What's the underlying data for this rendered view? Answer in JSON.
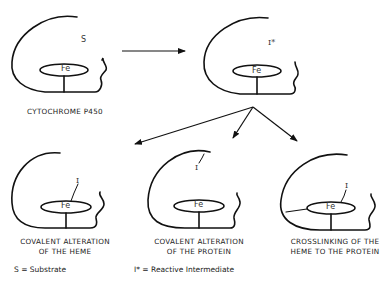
{
  "diagram": {
    "nodes": [
      {
        "id": "p450",
        "caption_line1": "CYTOCHROME  P450",
        "caption_line2": "",
        "symbol": "S",
        "heme_label": "Fe"
      },
      {
        "id": "intermediate",
        "caption_line1": "",
        "caption_line2": "",
        "symbol": "I*",
        "heme_label": "Fe"
      },
      {
        "id": "heme-alteration",
        "caption_line1": "COVALENT  ALTERATION",
        "caption_line2": "OF THE HEME",
        "symbol": "I",
        "heme_label": "Fe"
      },
      {
        "id": "protein-alteration",
        "caption_line1": "COVALENT  ALTERATION",
        "caption_line2": "OF THE PROTEIN",
        "symbol": "I",
        "heme_label": "Fe"
      },
      {
        "id": "crosslinking",
        "caption_line1": "CROSSLINKING  OF  THE",
        "caption_line2": "HEME  TO  THE  PROTEIN",
        "symbol": "I",
        "heme_label": "Fe"
      }
    ],
    "edges": [
      {
        "from": "p450",
        "to": "intermediate"
      },
      {
        "from": "intermediate",
        "to": "heme-alteration"
      },
      {
        "from": "intermediate",
        "to": "protein-alteration"
      },
      {
        "from": "intermediate",
        "to": "crosslinking"
      }
    ],
    "legend": {
      "substrate": "S  =  Substrate",
      "intermediate": "I*  =  Reactive  Intermediate"
    },
    "colors": {
      "stroke": "#111111",
      "text": "#222222",
      "background": "#ffffff"
    }
  }
}
